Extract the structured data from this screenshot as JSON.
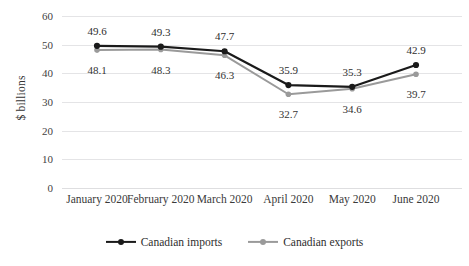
{
  "chart_data": {
    "type": "line",
    "title": "",
    "xlabel": "",
    "ylabel": "$ billions",
    "ylim": [
      0,
      60
    ],
    "yticks": [
      0,
      10,
      20,
      30,
      40,
      50,
      60
    ],
    "ytick_labels": [
      "0",
      "10",
      "20",
      "30",
      "40",
      "50",
      "60"
    ],
    "grid": true,
    "legend_position": "bottom",
    "categories": [
      "January 2020",
      "February 2020",
      "March 2020",
      "April 2020",
      "May 2020",
      "June 2020"
    ],
    "series": [
      {
        "name": "Canadian imports",
        "color": "#1a1a1a",
        "marker": "circle",
        "label_position": "above",
        "values": [
          49.6,
          49.3,
          47.7,
          35.9,
          35.3,
          42.9
        ],
        "value_labels": [
          "49.6",
          "49.3",
          "47.7",
          "35.9",
          "35.3",
          "42.9"
        ]
      },
      {
        "name": "Canadian exports",
        "color": "#9a9a9a",
        "marker": "circle",
        "label_position": "below",
        "values": [
          48.1,
          48.3,
          46.3,
          32.7,
          34.6,
          39.7
        ],
        "value_labels": [
          "48.1",
          "48.3",
          "46.3",
          "32.7",
          "34.6",
          "39.7"
        ]
      }
    ]
  },
  "legend": {
    "items": [
      {
        "label": "Canadian imports",
        "color": "#1a1a1a"
      },
      {
        "label": "Canadian exports",
        "color": "#9a9a9a"
      }
    ]
  },
  "colors": {
    "imports": "#1a1a1a",
    "exports": "#9a9a9a",
    "gridline": "#e4e4e6",
    "text": "#3a3a3a",
    "background": "#ffffff"
  }
}
